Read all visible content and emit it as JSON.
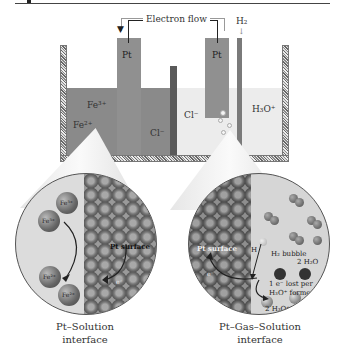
{
  "diagram": {
    "cell": {
      "electron_flow_label": "Electron flow",
      "h2_label": "H₂",
      "left_electrode_label": "Pt",
      "right_electrode_label": "Pt",
      "fe3_label": "Fe³⁺",
      "fe2_label": "Fe²⁺",
      "cl_left_label": "Cl⁻",
      "cl_right_label": "Cl⁻",
      "h3o_label": "H₃O⁺"
    },
    "left_zoom": {
      "ions": [
        "Fe³⁺",
        "Fe³⁺",
        "Fe²⁺",
        "Fe²⁺"
      ],
      "surface_label": "Pt surface",
      "electron_label": "e⁻",
      "caption_line1": "Pt–Solution",
      "caption_line2": "interface"
    },
    "right_zoom": {
      "surface_label": "Pt surface",
      "h_label": "H",
      "bubble_label": "H₂ bubble",
      "water_label": "2 H₂O",
      "lost_line1": "1 e⁻ lost per",
      "lost_line2": "H₃O⁺ formed",
      "product_label": "2 H₃O⁺",
      "electron_label": "e⁻",
      "caption_line1": "Pt–Gas–Solution",
      "caption_line2": "interface"
    }
  }
}
